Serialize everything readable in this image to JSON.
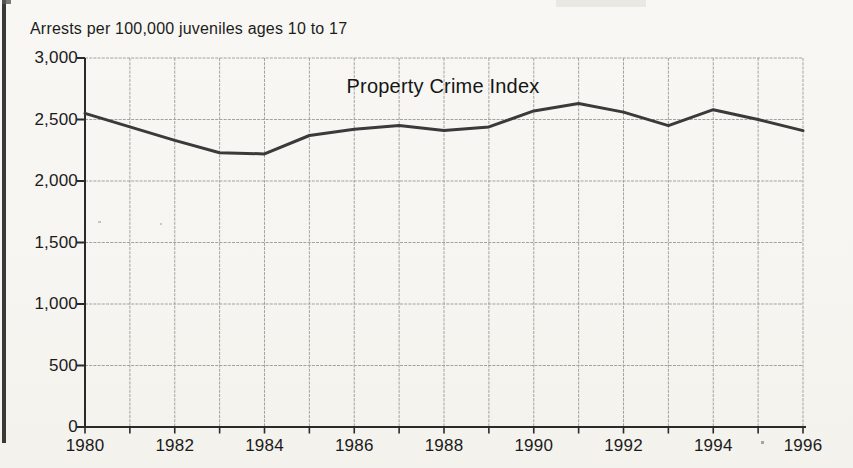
{
  "note": "Arrests per 100,000 juveniles ages 10 to 17",
  "chart_data": {
    "type": "line",
    "title": "Property Crime Index",
    "ylabel": "Arrests per 100,000 juveniles ages 10 to 17",
    "xlabel": "",
    "x": [
      1980,
      1981,
      1982,
      1983,
      1984,
      1985,
      1986,
      1987,
      1988,
      1989,
      1990,
      1991,
      1992,
      1993,
      1994,
      1995,
      1996
    ],
    "series": [
      {
        "name": "Property Crime Index",
        "values": [
          2550,
          2440,
          2330,
          2230,
          2220,
          2370,
          2420,
          2450,
          2410,
          2440,
          2570,
          2630,
          2560,
          2450,
          2580,
          2500,
          2410
        ]
      }
    ],
    "xlim": [
      1980,
      1996
    ],
    "ylim": [
      0,
      3000
    ],
    "yticks": [
      0,
      500,
      1000,
      1500,
      2000,
      2500,
      3000
    ],
    "ytick_labels": [
      "0",
      "500",
      "1,000",
      "1,500",
      "2,000",
      "2,500",
      "3,000"
    ],
    "xticks_labeled": [
      1980,
      1982,
      1984,
      1986,
      1988,
      1990,
      1992,
      1994,
      1996
    ],
    "xtick_labels": [
      "1980",
      "1982",
      "1984",
      "1986",
      "1988",
      "1990",
      "1992",
      "1994",
      "1996"
    ],
    "minor_xticks_every_year": true,
    "grid": "both",
    "legend": "none",
    "line_color": "#3a3a3a",
    "grid_color": "#a4a39b",
    "axis_color": "#2a2a2a",
    "text_color": "#1b1b1b",
    "background": "#f7f6f2"
  }
}
